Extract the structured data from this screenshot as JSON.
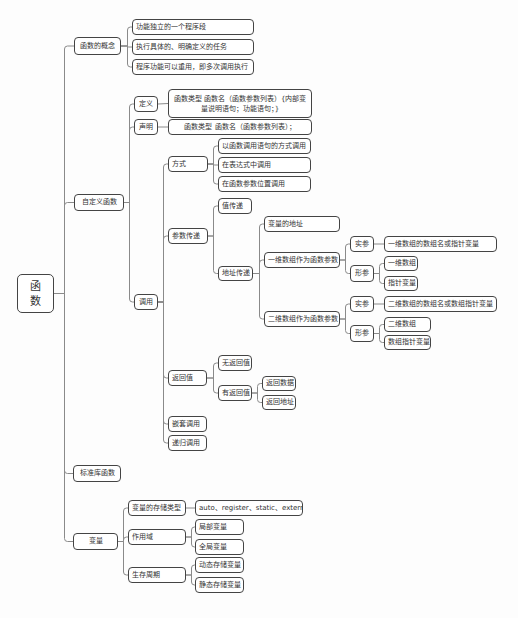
{
  "title": "函数",
  "root": {
    "label": "函\n数",
    "x": 17,
    "y": 274,
    "w": 37,
    "h": 39
  },
  "nodes": [
    {
      "id": "concept",
      "label": "函数的概念",
      "x": 74,
      "y": 37,
      "w": 47,
      "h": 18,
      "center": true
    },
    {
      "id": "concept-1",
      "label": "功能独立的一个程序段",
      "x": 132,
      "y": 19,
      "w": 122,
      "h": 16
    },
    {
      "id": "concept-2",
      "label": "执行具体的、明确定义的任务",
      "x": 132,
      "y": 39,
      "w": 122,
      "h": 16
    },
    {
      "id": "concept-3",
      "label": "程序功能可以重用，即多次调用执行",
      "x": 132,
      "y": 59,
      "w": 122,
      "h": 16
    },
    {
      "id": "custom",
      "label": "自定义函数",
      "x": 74,
      "y": 194,
      "w": 50,
      "h": 17,
      "center": true
    },
    {
      "id": "define",
      "label": "定义",
      "x": 134,
      "y": 96,
      "w": 24,
      "h": 16,
      "center": true
    },
    {
      "id": "define-body",
      "label": "函数类型 函数名（函数参数列表）{内部变量说明语句；功能语句；}",
      "x": 168,
      "y": 89,
      "w": 144,
      "h": 29,
      "center": true
    },
    {
      "id": "declare",
      "label": "声明",
      "x": 134,
      "y": 119,
      "w": 24,
      "h": 16,
      "center": true
    },
    {
      "id": "declare-body",
      "label": "函数类型 函数名（函数参数列表）；",
      "x": 168,
      "y": 119,
      "w": 144,
      "h": 16,
      "center": true
    },
    {
      "id": "call",
      "label": "调用",
      "x": 134,
      "y": 294,
      "w": 24,
      "h": 16,
      "center": true
    },
    {
      "id": "mode",
      "label": "方式",
      "x": 168,
      "y": 156,
      "w": 40,
      "h": 16
    },
    {
      "id": "mode-1",
      "label": "以函数调用语句的方式调用",
      "x": 218,
      "y": 138,
      "w": 93,
      "h": 16
    },
    {
      "id": "mode-2",
      "label": "在表达式中调用",
      "x": 218,
      "y": 157,
      "w": 93,
      "h": 16
    },
    {
      "id": "mode-3",
      "label": "在函数参数位置调用",
      "x": 218,
      "y": 176,
      "w": 93,
      "h": 16
    },
    {
      "id": "param",
      "label": "参数传递",
      "x": 168,
      "y": 228,
      "w": 40,
      "h": 16
    },
    {
      "id": "byval",
      "label": "值传递",
      "x": 218,
      "y": 198,
      "w": 34,
      "h": 16
    },
    {
      "id": "byaddr",
      "label": "地址传递",
      "x": 218,
      "y": 266,
      "w": 35,
      "h": 15
    },
    {
      "id": "addr-var",
      "label": "变量的地址",
      "x": 264,
      "y": 216,
      "w": 76,
      "h": 16
    },
    {
      "id": "arr1",
      "label": "一维数组作为函数参数",
      "x": 264,
      "y": 252,
      "w": 76,
      "h": 16
    },
    {
      "id": "arr1-actual",
      "label": "实参",
      "x": 350,
      "y": 236,
      "w": 24,
      "h": 16,
      "center": true
    },
    {
      "id": "arr1-actual-body",
      "label": "一维数组的数组名或指针变量",
      "x": 384,
      "y": 236,
      "w": 113,
      "h": 16
    },
    {
      "id": "arr1-formal",
      "label": "形参",
      "x": 350,
      "y": 265,
      "w": 24,
      "h": 17,
      "center": true
    },
    {
      "id": "arr1-formal-1",
      "label": "一维数组",
      "x": 384,
      "y": 256,
      "w": 34,
      "h": 15
    },
    {
      "id": "arr1-formal-2",
      "label": "指针变量",
      "x": 384,
      "y": 276,
      "w": 34,
      "h": 15
    },
    {
      "id": "arr2",
      "label": "二维数组作为函数参数",
      "x": 264,
      "y": 311,
      "w": 76,
      "h": 16
    },
    {
      "id": "arr2-actual",
      "label": "实参",
      "x": 350,
      "y": 296,
      "w": 24,
      "h": 16,
      "center": true
    },
    {
      "id": "arr2-actual-body",
      "label": "二维数组的数组名或数组指针变量",
      "x": 384,
      "y": 296,
      "w": 113,
      "h": 16
    },
    {
      "id": "arr2-formal",
      "label": "形参",
      "x": 350,
      "y": 325,
      "w": 24,
      "h": 17,
      "center": true
    },
    {
      "id": "arr2-formal-1",
      "label": "二维数组",
      "x": 384,
      "y": 317,
      "w": 47,
      "h": 15
    },
    {
      "id": "arr2-formal-2",
      "label": "数组指针变量",
      "x": 384,
      "y": 335,
      "w": 47,
      "h": 15
    },
    {
      "id": "ret",
      "label": "返回值",
      "x": 168,
      "y": 370,
      "w": 39,
      "h": 16
    },
    {
      "id": "ret-none",
      "label": "无返回值",
      "x": 218,
      "y": 355,
      "w": 34,
      "h": 16
    },
    {
      "id": "ret-has",
      "label": "有返回值",
      "x": 218,
      "y": 385,
      "w": 34,
      "h": 16
    },
    {
      "id": "ret-data",
      "label": "返回数据",
      "x": 262,
      "y": 376,
      "w": 34,
      "h": 15
    },
    {
      "id": "ret-addr",
      "label": "返回地址",
      "x": 262,
      "y": 395,
      "w": 34,
      "h": 15
    },
    {
      "id": "nested",
      "label": "嵌套调用",
      "x": 168,
      "y": 416,
      "w": 39,
      "h": 16
    },
    {
      "id": "recursive",
      "label": "递归调用",
      "x": 168,
      "y": 435,
      "w": 39,
      "h": 16
    },
    {
      "id": "stdlib",
      "label": "标准库函数",
      "x": 73,
      "y": 465,
      "w": 48,
      "h": 17,
      "center": true
    },
    {
      "id": "var",
      "label": "变量",
      "x": 73,
      "y": 533,
      "w": 45,
      "h": 17,
      "center": true
    },
    {
      "id": "storage",
      "label": "变量的存储类型",
      "x": 128,
      "y": 500,
      "w": 58,
      "h": 16
    },
    {
      "id": "storage-body",
      "label": "auto、register、static、extern",
      "x": 195,
      "y": 500,
      "w": 108,
      "h": 16
    },
    {
      "id": "scope",
      "label": "作用域",
      "x": 128,
      "y": 529,
      "w": 58,
      "h": 16
    },
    {
      "id": "scope-local",
      "label": "局部变量",
      "x": 195,
      "y": 519,
      "w": 49,
      "h": 16
    },
    {
      "id": "scope-global",
      "label": "全局变量",
      "x": 195,
      "y": 539,
      "w": 49,
      "h": 16
    },
    {
      "id": "lifetime",
      "label": "生存周期",
      "x": 128,
      "y": 567,
      "w": 58,
      "h": 16
    },
    {
      "id": "life-dynamic",
      "label": "动态存储变量",
      "x": 195,
      "y": 557,
      "w": 49,
      "h": 16
    },
    {
      "id": "life-static",
      "label": "静态存储变量",
      "x": 195,
      "y": 577,
      "w": 49,
      "h": 16
    }
  ],
  "edges": [
    [
      "root",
      "concept"
    ],
    [
      "root",
      "custom"
    ],
    [
      "root",
      "stdlib"
    ],
    [
      "root",
      "var"
    ],
    [
      "concept",
      "concept-1"
    ],
    [
      "concept",
      "concept-2"
    ],
    [
      "concept",
      "concept-3"
    ],
    [
      "custom",
      "define"
    ],
    [
      "custom",
      "declare"
    ],
    [
      "custom",
      "call"
    ],
    [
      "define",
      "define-body"
    ],
    [
      "declare",
      "declare-body"
    ],
    [
      "call",
      "mode"
    ],
    [
      "call",
      "param"
    ],
    [
      "call",
      "ret"
    ],
    [
      "call",
      "nested"
    ],
    [
      "call",
      "recursive"
    ],
    [
      "mode",
      "mode-1"
    ],
    [
      "mode",
      "mode-2"
    ],
    [
      "mode",
      "mode-3"
    ],
    [
      "param",
      "byval"
    ],
    [
      "param",
      "byaddr"
    ],
    [
      "byaddr",
      "addr-var"
    ],
    [
      "byaddr",
      "arr1"
    ],
    [
      "byaddr",
      "arr2"
    ],
    [
      "arr1",
      "arr1-actual"
    ],
    [
      "arr1",
      "arr1-formal"
    ],
    [
      "arr1-actual",
      "arr1-actual-body"
    ],
    [
      "arr1-formal",
      "arr1-formal-1"
    ],
    [
      "arr1-formal",
      "arr1-formal-2"
    ],
    [
      "arr2",
      "arr2-actual"
    ],
    [
      "arr2",
      "arr2-formal"
    ],
    [
      "arr2-actual",
      "arr2-actual-body"
    ],
    [
      "arr2-formal",
      "arr2-formal-1"
    ],
    [
      "arr2-formal",
      "arr2-formal-2"
    ],
    [
      "ret",
      "ret-none"
    ],
    [
      "ret",
      "ret-has"
    ],
    [
      "ret-has",
      "ret-data"
    ],
    [
      "ret-has",
      "ret-addr"
    ],
    [
      "var",
      "storage"
    ],
    [
      "var",
      "scope"
    ],
    [
      "var",
      "lifetime"
    ],
    [
      "storage",
      "storage-body"
    ],
    [
      "scope",
      "scope-local"
    ],
    [
      "scope",
      "scope-global"
    ],
    [
      "lifetime",
      "life-dynamic"
    ],
    [
      "lifetime",
      "life-static"
    ]
  ],
  "colors": {
    "border": "#444444",
    "line": "#8a8a8a",
    "text": "#333333",
    "background": "#fdfdfd"
  }
}
